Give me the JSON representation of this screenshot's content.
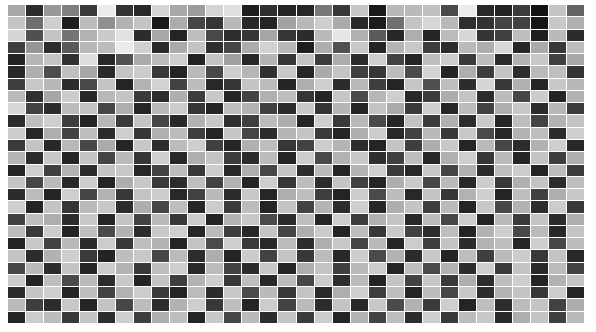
{
  "figure": {
    "title": "",
    "background_color": "#ffffff",
    "grid_line_color": "#ffffff",
    "plot_left": 8,
    "plot_top": 5,
    "plot_width": 576,
    "plot_height": 318
  },
  "caption": {
    "visible_fragment": "",
    "note": "clipped caption sliver, illegible"
  },
  "chart_data": {
    "type": "heatmap",
    "title": "",
    "xlabel": "",
    "ylabel": "",
    "xticklabels": [],
    "yticklabels": [],
    "grid": true,
    "legend": null,
    "colormap": "gray",
    "vmin": 0,
    "vmax": 255,
    "ncols": 32,
    "nrows": 26,
    "values": [
      [
        168,
        44,
        152,
        128,
        58,
        236,
        52,
        40,
        214,
        168,
        156,
        212,
        224,
        30,
        48,
        36,
        38,
        120,
        56,
        198,
        26,
        184,
        186,
        192,
        74,
        236,
        40,
        34,
        60,
        18,
        196,
        100
      ],
      [
        196,
        110,
        206,
        30,
        188,
        144,
        178,
        196,
        26,
        172,
        70,
        54,
        184,
        40,
        36,
        162,
        184,
        206,
        170,
        42,
        28,
        112,
        196,
        214,
        184,
        46,
        50,
        68,
        66,
        22,
        200,
        176
      ],
      [
        214,
        80,
        196,
        116,
        178,
        202,
        226,
        44,
        168,
        36,
        190,
        72,
        46,
        54,
        166,
        54,
        44,
        186,
        230,
        176,
        90,
        38,
        174,
        36,
        188,
        216,
        52,
        64,
        190,
        30,
        186,
        44
      ],
      [
        62,
        150,
        44,
        90,
        184,
        188,
        236,
        208,
        40,
        170,
        196,
        46,
        70,
        172,
        210,
        184,
        30,
        174,
        80,
        200,
        36,
        180,
        200,
        60,
        44,
        186,
        174,
        216,
        38,
        170,
        56,
        190
      ],
      [
        34,
        182,
        196,
        50,
        222,
        40,
        82,
        170,
        188,
        206,
        34,
        196,
        160,
        40,
        180,
        54,
        196,
        60,
        172,
        44,
        206,
        66,
        36,
        190,
        204,
        58,
        188,
        42,
        178,
        200,
        64,
        168
      ],
      [
        40,
        174,
        78,
        192,
        168,
        42,
        196,
        204,
        56,
        36,
        186,
        72,
        206,
        182,
        48,
        200,
        38,
        170,
        196,
        64,
        54,
        188,
        74,
        212,
        36,
        174,
        60,
        196,
        44,
        186,
        190,
        52
      ],
      [
        62,
        200,
        184,
        44,
        72,
        196,
        36,
        178,
        210,
        66,
        188,
        40,
        54,
        196,
        188,
        36,
        174,
        206,
        44,
        186,
        62,
        36,
        198,
        80,
        190,
        44,
        214,
        56,
        176,
        36,
        200,
        184
      ],
      [
        186,
        48,
        166,
        204,
        40,
        184,
        196,
        58,
        44,
        174,
        60,
        200,
        38,
        68,
        176,
        190,
        52,
        36,
        198,
        74,
        182,
        206,
        40,
        60,
        172,
        196,
        44,
        188,
        70,
        204,
        36,
        178
      ],
      [
        216,
        66,
        44,
        188,
        196,
        70,
        174,
        38,
        186,
        204,
        54,
        36,
        190,
        178,
        64,
        44,
        200,
        52,
        182,
        36,
        196,
        170,
        58,
        206,
        38,
        188,
        66,
        174,
        200,
        44,
        184,
        60
      ],
      [
        44,
        190,
        206,
        62,
        36,
        182,
        58,
        196,
        70,
        40,
        178,
        200,
        46,
        64,
        188,
        174,
        36,
        206,
        56,
        184,
        74,
        38,
        194,
        60,
        176,
        44,
        202,
        36,
        190,
        68,
        178,
        196
      ],
      [
        204,
        38,
        174,
        66,
        190,
        44,
        206,
        54,
        176,
        188,
        62,
        36,
        198,
        70,
        44,
        182,
        196,
        58,
        36,
        174,
        204,
        40,
        66,
        186,
        56,
        200,
        74,
        38,
        178,
        190,
        44,
        206
      ],
      [
        58,
        196,
        40,
        184,
        72,
        170,
        36,
        200,
        44,
        188,
        206,
        64,
        38,
        176,
        190,
        54,
        66,
        204,
        180,
        44,
        36,
        196,
        62,
        174,
        200,
        36,
        186,
        70,
        44,
        178,
        206,
        40
      ],
      [
        182,
        44,
        200,
        36,
        196,
        68,
        186,
        54,
        206,
        40,
        174,
        196,
        60,
        44,
        188,
        36,
        204,
        72,
        178,
        200,
        46,
        64,
        190,
        38,
        176,
        206,
        54,
        186,
        36,
        196,
        62,
        174
      ],
      [
        36,
        206,
        64,
        178,
        44,
        196,
        200,
        38,
        66,
        188,
        56,
        204,
        40,
        174,
        70,
        196,
        44,
        186,
        36,
        180,
        206,
        58,
        40,
        200,
        68,
        176,
        44,
        190,
        204,
        36,
        188,
        60
      ],
      [
        196,
        70,
        186,
        40,
        204,
        36,
        174,
        200,
        58,
        44,
        190,
        66,
        178,
        36,
        206,
        54,
        188,
        44,
        196,
        64,
        36,
        174,
        202,
        70,
        186,
        40,
        204,
        56,
        176,
        196,
        44,
        190
      ],
      [
        44,
        188,
        36,
        206,
        68,
        178,
        56,
        196,
        204,
        40,
        66,
        186,
        44,
        200,
        38,
        174,
        190,
        62,
        36,
        204,
        74,
        188,
        40,
        196,
        54,
        178,
        206,
        36,
        190,
        64,
        174,
        200
      ],
      [
        206,
        36,
        196,
        54,
        186,
        200,
        44,
        174,
        70,
        190,
        38,
        204,
        58,
        188,
        36,
        196,
        66,
        180,
        44,
        206,
        40,
        174,
        196,
        62,
        186,
        36,
        200,
        72,
        178,
        44,
        204,
        56
      ],
      [
        64,
        190,
        174,
        44,
        200,
        38,
        196,
        66,
        186,
        56,
        204,
        36,
        178,
        200,
        74,
        44,
        190,
        38,
        206,
        60,
        176,
        196,
        40,
        188,
        70,
        204,
        36,
        186,
        58,
        196,
        44,
        174
      ],
      [
        188,
        56,
        204,
        36,
        190,
        74,
        178,
        44,
        200,
        206,
        38,
        186,
        62,
        40,
        196,
        70,
        174,
        204,
        36,
        188,
        54,
        200,
        66,
        44,
        190,
        36,
        178,
        206,
        72,
        186,
        40,
        196
      ],
      [
        36,
        200,
        66,
        186,
        44,
        204,
        56,
        190,
        178,
        36,
        196,
        74,
        206,
        58,
        40,
        188,
        44,
        174,
        200,
        68,
        186,
        36,
        204,
        62,
        196,
        44,
        178,
        190,
        36,
        206,
        70,
        188
      ],
      [
        196,
        44,
        178,
        206,
        58,
        36,
        190,
        200,
        70,
        186,
        44,
        174,
        36,
        204,
        66,
        196,
        56,
        188,
        40,
        206,
        74,
        178,
        44,
        200,
        36,
        190,
        62,
        186,
        204,
        56,
        196,
        40
      ],
      [
        70,
        186,
        44,
        196,
        36,
        204,
        178,
        56,
        190,
        206,
        40,
        188,
        66,
        44,
        200,
        36,
        174,
        196,
        62,
        186,
        204,
        36,
        190,
        74,
        178,
        44,
        206,
        58,
        196,
        40,
        188,
        66
      ],
      [
        204,
        36,
        190,
        74,
        186,
        44,
        200,
        36,
        196,
        62,
        178,
        206,
        56,
        190,
        40,
        188,
        70,
        204,
        44,
        186,
        36,
        196,
        66,
        200,
        58,
        174,
        44,
        190,
        206,
        36,
        178,
        196
      ],
      [
        44,
        196,
        206,
        36,
        190,
        66,
        178,
        204,
        58,
        36,
        188,
        44,
        200,
        74,
        186,
        56,
        196,
        40,
        174,
        206,
        62,
        190,
        36,
        188,
        70,
        200,
        44,
        178,
        196,
        56,
        204,
        36
      ],
      [
        186,
        62,
        44,
        200,
        36,
        196,
        70,
        188,
        44,
        178,
        206,
        56,
        190,
        36,
        204,
        66,
        186,
        44,
        196,
        40,
        200,
        74,
        178,
        58,
        206,
        36,
        190,
        44,
        188,
        196,
        66,
        174
      ],
      [
        36,
        204,
        188,
        56,
        196,
        44,
        206,
        62,
        174,
        190,
        36,
        200,
        70,
        186,
        44,
        196,
        58,
        204,
        36,
        178,
        66,
        190,
        44,
        206,
        56,
        188,
        200,
        40,
        174,
        196,
        62,
        186
      ]
    ]
  }
}
